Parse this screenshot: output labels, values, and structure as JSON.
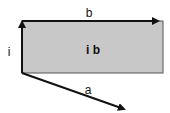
{
  "diagram": {
    "type": "vector-cross-product",
    "labels": {
      "vector_i": "i",
      "vector_b": "b",
      "vector_a": "a",
      "area": "i b"
    },
    "colors": {
      "rectangle_fill": "#c8c8c8",
      "stroke": "#111111",
      "background": "#ffffff"
    }
  }
}
